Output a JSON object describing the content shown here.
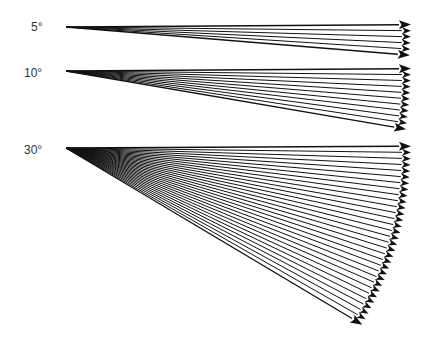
{
  "diagram": {
    "arrow_color": "#111111",
    "arrow_length": 345,
    "fans": [
      {
        "label": "5°",
        "origin": [
          66,
          27
        ],
        "start_deg": -0.4,
        "end_deg": 4.7,
        "step_deg": 1,
        "count": 6
      },
      {
        "label": "10°",
        "origin": [
          66,
          71
        ],
        "start_deg": -0.4,
        "end_deg": 9.7,
        "step_deg": 1,
        "count": 11
      },
      {
        "label": "30°",
        "origin": [
          66,
          148
        ],
        "start_deg": -0.3,
        "end_deg": 30.8,
        "step_deg": 1,
        "count": 31
      }
    ]
  }
}
